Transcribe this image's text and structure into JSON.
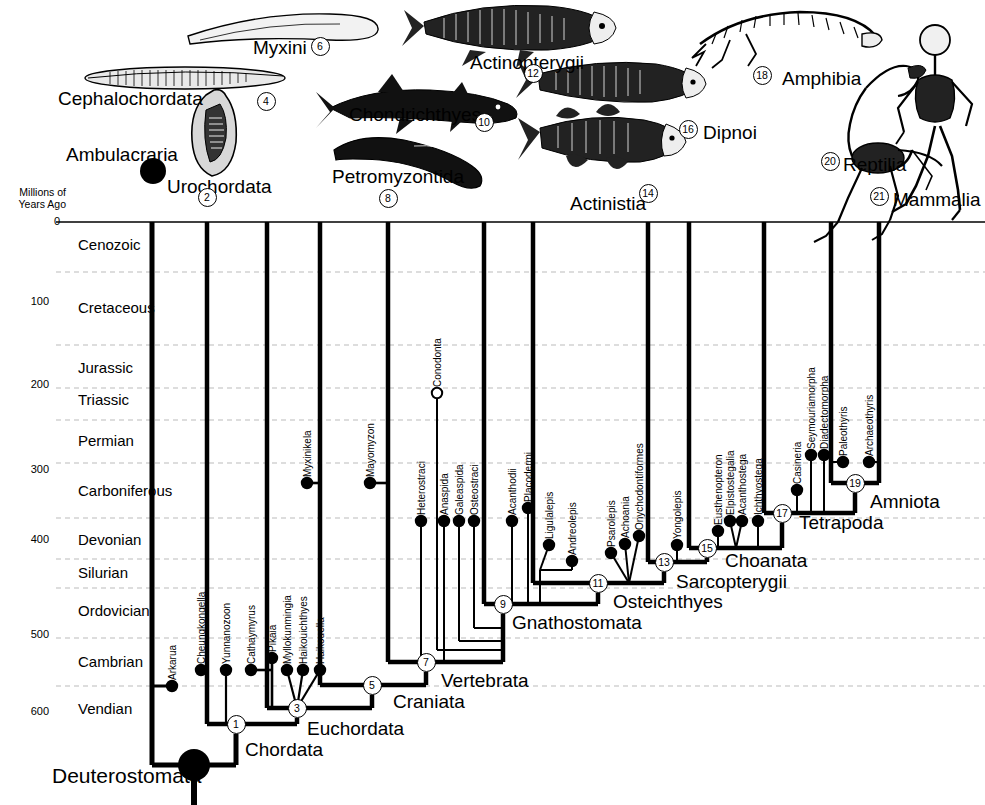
{
  "axis": {
    "caption_line1": "Millions of",
    "caption_line2": "Years Ago",
    "ticks": [
      {
        "value": "0",
        "y": 222
      },
      {
        "value": "100",
        "y": 302
      },
      {
        "value": "200",
        "y": 385
      },
      {
        "value": "300",
        "y": 470
      },
      {
        "value": "400",
        "y": 540
      },
      {
        "value": "500",
        "y": 635
      },
      {
        "value": "600",
        "y": 712
      }
    ]
  },
  "periods": [
    {
      "name": "Cenozoic",
      "y": 245,
      "boundary": 222
    },
    {
      "name": "Cretaceous",
      "y": 308,
      "boundary": 272
    },
    {
      "name": "Jurassic",
      "y": 368,
      "boundary": 345
    },
    {
      "name": "Triassic",
      "y": 400,
      "boundary": 388
    },
    {
      "name": "Permian",
      "y": 441,
      "boundary": 420
    },
    {
      "name": "Carboniferous",
      "y": 491,
      "boundary": 463
    },
    {
      "name": "Devonian",
      "y": 540,
      "boundary": 518
    },
    {
      "name": "Silurian",
      "y": 573,
      "boundary": 559
    },
    {
      "name": "Ordovician",
      "y": 611,
      "boundary": 588
    },
    {
      "name": "Cambrian",
      "y": 662,
      "boundary": 638
    },
    {
      "name": "Vendian",
      "y": 709,
      "boundary": 686
    }
  ],
  "clades": [
    {
      "label": "Ambulacraria",
      "x": 66,
      "y": 145,
      "size": "clade-big"
    },
    {
      "label": "Cephalochordata",
      "x": 58,
      "y": 89,
      "size": "clade-big"
    },
    {
      "label": "Urochordata",
      "x": 167,
      "y": 177,
      "size": "clade-big"
    },
    {
      "label": "Myxini",
      "x": 253,
      "y": 38,
      "size": "clade-big"
    },
    {
      "label": "Petromyzontida",
      "x": 332,
      "y": 167,
      "size": "clade-big"
    },
    {
      "label": "Chondrichthyes",
      "x": 349,
      "y": 105,
      "size": "clade-big"
    },
    {
      "label": "Actinopterygii",
      "x": 470,
      "y": 53,
      "size": "clade-big"
    },
    {
      "label": "Actinistia",
      "x": 570,
      "y": 194,
      "size": "clade-big"
    },
    {
      "label": "Dipnoi",
      "x": 703,
      "y": 123,
      "size": "clade-big"
    },
    {
      "label": "Amphibia",
      "x": 782,
      "y": 69,
      "size": "clade-big"
    },
    {
      "label": "Reptilia",
      "x": 843,
      "y": 155,
      "size": "clade-big"
    },
    {
      "label": "Mammalia",
      "x": 893,
      "y": 190,
      "size": "clade-big"
    },
    {
      "label": "Deuterostomata",
      "x": 52,
      "y": 765,
      "size": "clade-huge"
    },
    {
      "label": "Chordata",
      "x": 245,
      "y": 740,
      "size": "clade-big"
    },
    {
      "label": "Euchordata",
      "x": 307,
      "y": 719,
      "size": "clade-big"
    },
    {
      "label": "Craniata",
      "x": 393,
      "y": 692,
      "size": "clade-big"
    },
    {
      "label": "Vertebrata",
      "x": 441,
      "y": 671,
      "size": "clade-big"
    },
    {
      "label": "Gnathostomata",
      "x": 512,
      "y": 613,
      "size": "clade-big"
    },
    {
      "label": "Osteichthyes",
      "x": 613,
      "y": 592,
      "size": "clade-big"
    },
    {
      "label": "Sarcopterygii",
      "x": 676,
      "y": 572,
      "size": "clade-big"
    },
    {
      "label": "Choanata",
      "x": 725,
      "y": 551,
      "size": "clade-big"
    },
    {
      "label": "Tetrapoda",
      "x": 799,
      "y": 513,
      "size": "clade-big"
    },
    {
      "label": "Amniota",
      "x": 870,
      "y": 492,
      "size": "clade-big"
    }
  ],
  "nodes": [
    {
      "n": "1",
      "x": 236,
      "y": 724
    },
    {
      "n": "2",
      "x": 207,
      "y": 197
    },
    {
      "n": "3",
      "x": 297,
      "y": 708
    },
    {
      "n": "4",
      "x": 266,
      "y": 101
    },
    {
      "n": "5",
      "x": 372,
      "y": 685
    },
    {
      "n": "6",
      "x": 320,
      "y": 46
    },
    {
      "n": "7",
      "x": 426,
      "y": 662
    },
    {
      "n": "8",
      "x": 388,
      "y": 198
    },
    {
      "n": "9",
      "x": 503,
      "y": 604
    },
    {
      "n": "10",
      "x": 484,
      "y": 122
    },
    {
      "n": "11",
      "x": 598,
      "y": 583
    },
    {
      "n": "12",
      "x": 533,
      "y": 73
    },
    {
      "n": "13",
      "x": 664,
      "y": 562
    },
    {
      "n": "14",
      "x": 648,
      "y": 193
    },
    {
      "n": "15",
      "x": 707,
      "y": 548
    },
    {
      "n": "16",
      "x": 688,
      "y": 129
    },
    {
      "n": "17",
      "x": 782,
      "y": 513
    },
    {
      "n": "18",
      "x": 762,
      "y": 75
    },
    {
      "n": "19",
      "x": 855,
      "y": 483
    },
    {
      "n": "20",
      "x": 830,
      "y": 161
    },
    {
      "n": "21",
      "x": 879,
      "y": 196
    }
  ],
  "fossil_taxa": [
    {
      "name": "Arkarua",
      "x": 172,
      "y": 686,
      "filled": true,
      "label_y": 680
    },
    {
      "name": "Cheungkongella",
      "x": 201,
      "y": 670,
      "filled": true,
      "label_y": 664
    },
    {
      "name": "Yunnanozoon",
      "x": 226,
      "y": 670,
      "filled": true,
      "label_y": 664
    },
    {
      "name": "Cathaymyrus",
      "x": 251,
      "y": 670,
      "filled": true,
      "label_y": 664
    },
    {
      "name": "Pikaia",
      "x": 272,
      "y": 658,
      "filled": true,
      "label_y": 652
    },
    {
      "name": "Myllokunmingia",
      "x": 287,
      "y": 670,
      "filled": true,
      "label_y": 664
    },
    {
      "name": "Haikouichthyes",
      "x": 303,
      "y": 670,
      "filled": true,
      "label_y": 664
    },
    {
      "name": "Haikouella",
      "x": 320,
      "y": 670,
      "filled": true,
      "label_y": 664
    },
    {
      "name": "Myxinikela",
      "x": 307,
      "y": 483,
      "filled": true,
      "label_y": 477
    },
    {
      "name": "Mayomyzon",
      "x": 370,
      "y": 483,
      "filled": true,
      "label_y": 477
    },
    {
      "name": "Conodonta",
      "x": 437,
      "y": 393,
      "filled": false,
      "label_y": 387
    },
    {
      "name": "Heterostraci",
      "x": 421,
      "y": 521,
      "filled": true,
      "label_y": 515
    },
    {
      "name": "Anaspida",
      "x": 444,
      "y": 521,
      "filled": true,
      "label_y": 515
    },
    {
      "name": "Galeaspida",
      "x": 459,
      "y": 521,
      "filled": true,
      "label_y": 515
    },
    {
      "name": "Osteostraci",
      "x": 474,
      "y": 521,
      "filled": true,
      "label_y": 515
    },
    {
      "name": "Acanthodii",
      "x": 512,
      "y": 521,
      "filled": true,
      "label_y": 515
    },
    {
      "name": "Placodermi",
      "x": 528,
      "y": 508,
      "filled": true,
      "label_y": 502
    },
    {
      "name": "Ligulalepis",
      "x": 549,
      "y": 545,
      "filled": true,
      "label_y": 539
    },
    {
      "name": "Andreolepis",
      "x": 572,
      "y": 561,
      "filled": true,
      "label_y": 555
    },
    {
      "name": "Psarolepis",
      "x": 611,
      "y": 553,
      "filled": true,
      "label_y": 547
    },
    {
      "name": "Achoania",
      "x": 625,
      "y": 544,
      "filled": true,
      "label_y": 538
    },
    {
      "name": "Onychodontiformes",
      "x": 639,
      "y": 536,
      "filled": true,
      "label_y": 530
    },
    {
      "name": "Yongolepis",
      "x": 677,
      "y": 545,
      "filled": true,
      "label_y": 539
    },
    {
      "name": "Eusthenopteron",
      "x": 718,
      "y": 531,
      "filled": true,
      "label_y": 525
    },
    {
      "name": "Elpistostegalia",
      "x": 730,
      "y": 521,
      "filled": true,
      "label_y": 515
    },
    {
      "name": "Acanthostega",
      "x": 742,
      "y": 521,
      "filled": true,
      "label_y": 515
    },
    {
      "name": "Ichthyostega",
      "x": 758,
      "y": 521,
      "filled": true,
      "label_y": 515
    },
    {
      "name": "Casineria",
      "x": 797,
      "y": 490,
      "filled": true,
      "label_y": 484
    },
    {
      "name": "Seymouriamorpha",
      "x": 811,
      "y": 455,
      "filled": true,
      "label_y": 449
    },
    {
      "name": "Diadectomorpha",
      "x": 824,
      "y": 455,
      "filled": true,
      "label_y": 449
    },
    {
      "name": "Paleothyris",
      "x": 843,
      "y": 462,
      "filled": true,
      "label_y": 456
    },
    {
      "name": "Archaeothyris",
      "x": 869,
      "y": 462,
      "filled": true,
      "label_y": 456
    }
  ],
  "colors": {
    "line": "#000000",
    "gridline": "#bbbbbb",
    "background": "#ffffff"
  }
}
